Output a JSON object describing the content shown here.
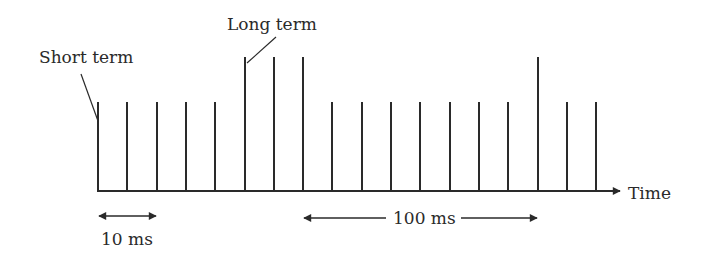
{
  "diagram": {
    "labels": {
      "short_term": "Short term",
      "long_term": "Long term",
      "time_axis": "Time",
      "interval_short": "10 ms",
      "interval_long": "100 ms"
    },
    "colors": {
      "ink": "#2a2a2a",
      "background": "#ffffff"
    },
    "axis": {
      "baseline_y": 191,
      "x_start": 97,
      "x_end": 622
    },
    "pulses": {
      "count": 18,
      "start_x": 98,
      "spacing": 29.3,
      "short_top_y": 102,
      "long_top_y": 57,
      "long_indices": [
        5,
        6,
        7,
        15
      ]
    },
    "intervals": [
      {
        "label_key": "interval_short",
        "x1": 98,
        "x2": 156,
        "y": 216,
        "text_x": 127,
        "text_y": 246
      },
      {
        "label_key": "interval_long",
        "x1": 304,
        "x2": 537,
        "y": 218,
        "text_x": 420,
        "text_y": 224
      }
    ]
  }
}
